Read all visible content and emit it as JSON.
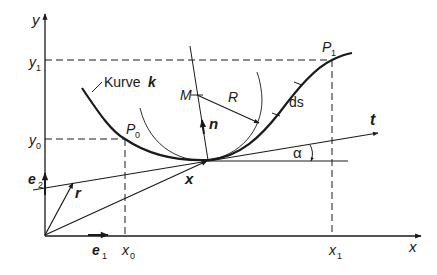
{
  "colors": {
    "ink": "#1a1a1a",
    "background": "#ffffff"
  },
  "axes": {
    "x_label": "x",
    "y_label": "y",
    "e1_label": "e",
    "e1_sub": "1",
    "e2_label": "e",
    "e2_sub": "2"
  },
  "ticks": {
    "x0": "x",
    "x0_sub": "0",
    "x1": "x",
    "x1_sub": "1",
    "y0": "y",
    "y0_sub": "0",
    "y1": "y",
    "y1_sub": "1"
  },
  "curve": {
    "label": "Kurve",
    "name": "k"
  },
  "points": {
    "P0": "P",
    "P0_sub": "0",
    "P1": "P",
    "P1_sub": "1",
    "M": "M"
  },
  "vectors": {
    "r": "r",
    "x": "x",
    "n": "n",
    "t": "t"
  },
  "labels": {
    "R": "R",
    "ds": "ds",
    "alpha": "α"
  }
}
